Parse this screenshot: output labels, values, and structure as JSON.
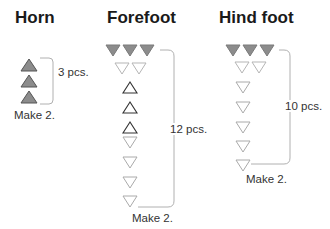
{
  "colors": {
    "filled": "#8c8c8c",
    "filled_stroke": "#555555",
    "light_outline": "#aaaaaa",
    "dark_outline": "#333333",
    "bracket": "#b0b0b0"
  },
  "sections": [
    {
      "title": "Horn",
      "count_label": "3 pcs.",
      "make_label": "Make 2.",
      "rows": [
        "filled-up",
        "filled-up",
        "filled-up"
      ]
    },
    {
      "title": "Forefoot",
      "count_label": "12 pcs.",
      "make_label": "Make 2.",
      "rows": [
        "3 filled-down",
        "2 light-down",
        "dark-up",
        "dark-up",
        "dark-up",
        "light-down",
        "light-down",
        "light-down",
        "light-down"
      ]
    },
    {
      "title": "Hind foot",
      "count_label": "10 pcs.",
      "make_label": "Make 2.",
      "rows": [
        "3 filled-down",
        "2 light-down",
        "light-down",
        "light-down",
        "light-down",
        "light-down",
        "light-down"
      ]
    }
  ]
}
